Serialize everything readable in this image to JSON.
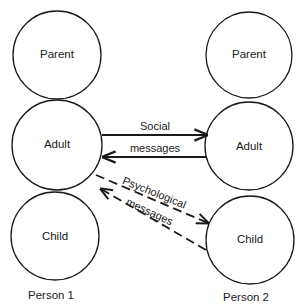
{
  "diagram": {
    "type": "transactional-analysis",
    "persons": [
      {
        "label": "Person 1",
        "states": [
          "Parent",
          "Adult",
          "Child"
        ]
      },
      {
        "label": "Person 2",
        "states": [
          "Parent",
          "Adult",
          "Child"
        ]
      }
    ],
    "messages": {
      "social": {
        "line1": "Social",
        "line2": "messages",
        "style": "solid",
        "connects": [
          "Person 1 Adult",
          "Person 2 Adult"
        ],
        "direction": "both"
      },
      "psychological": {
        "line1": "Psychological",
        "line2": "messages",
        "style": "dashed",
        "connects": [
          "Person 1 Adult/Child",
          "Person 2 Child"
        ],
        "direction": "both"
      }
    }
  }
}
